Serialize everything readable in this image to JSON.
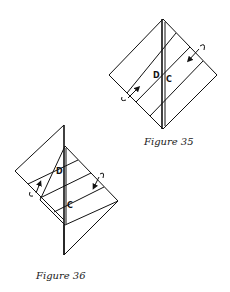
{
  "figures": [
    {
      "id": "figure-35",
      "caption": "Figure 35",
      "labels": {
        "left": "D",
        "right": "C"
      }
    },
    {
      "id": "figure-36",
      "caption": "Figure 36",
      "labels": {
        "top": "D",
        "bottom": "C"
      }
    }
  ],
  "colors": {
    "line": "#111111",
    "background": "#ffffff"
  }
}
